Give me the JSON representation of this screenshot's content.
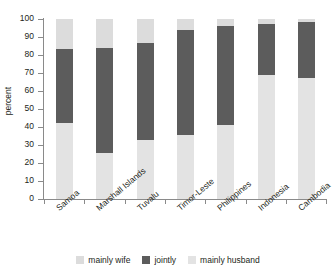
{
  "chart_data": {
    "type": "bar",
    "subtype": "stacked-percent",
    "title": "",
    "xlabel": "",
    "ylabel": "percent",
    "ylim": [
      0,
      100
    ],
    "yticks": [
      0,
      10,
      20,
      30,
      40,
      50,
      60,
      70,
      80,
      90,
      100
    ],
    "ytick_labels": [
      "0",
      "10",
      "20",
      "30",
      "40",
      "50",
      "60",
      "70",
      "80",
      "90",
      "100"
    ],
    "grid": false,
    "legend_position": "bottom",
    "stack_order_bottom_to_top": [
      "mainly husband",
      "jointly",
      "mainly wife"
    ],
    "categories": [
      "Samoa",
      "Marshall Islands",
      "Tuvalu",
      "Timor-Leste",
      "Philippines",
      "Indonesia",
      "Cambodia"
    ],
    "series": [
      {
        "name": "mainly wife",
        "color": "#dcdcdc",
        "values": [
          16.5,
          16.0,
          13.5,
          6.0,
          4.0,
          3.0,
          1.5
        ]
      },
      {
        "name": "jointly",
        "color": "#5c5c5c",
        "values": [
          41.5,
          58.5,
          53.5,
          58.5,
          55.0,
          28.0,
          31.5
        ]
      },
      {
        "name": "mainly husband",
        "color": "#e3e3e3",
        "values": [
          42.0,
          25.5,
          33.0,
          35.5,
          41.0,
          69.0,
          67.0
        ]
      }
    ],
    "cumulative_tops": {
      "mainly husband": [
        42.0,
        25.5,
        33.0,
        35.5,
        41.0,
        69.0,
        67.0
      ],
      "jointly": [
        83.5,
        84.0,
        86.5,
        94.0,
        96.0,
        97.0,
        98.5
      ],
      "mainly wife": [
        100,
        100,
        100,
        100,
        100,
        100,
        100
      ]
    }
  },
  "legend": {
    "items": [
      {
        "label": "mainly wife",
        "color": "#dcdcdc"
      },
      {
        "label": "jointly",
        "color": "#5c5c5c"
      },
      {
        "label": "mainly husband",
        "color": "#e3e3e3"
      }
    ]
  },
  "axis": {
    "y_title": "percent"
  },
  "colors": {
    "axis": "#8a8a8a",
    "text": "#231f20",
    "background": "#ffffff"
  }
}
